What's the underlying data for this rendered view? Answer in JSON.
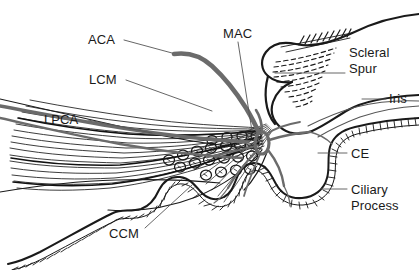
{
  "figure": {
    "type": "anatomical-line-drawing",
    "width": 419,
    "height": 270,
    "background_color": "#ffffff",
    "ink_color": "#1a1a1a",
    "vessel_color": "#6b6b6b",
    "leader_color": "#555555"
  },
  "labels": {
    "aca": {
      "text": "ACA",
      "full_name": "anterior ciliary artery",
      "x": 88,
      "y": 32,
      "leader": {
        "x1": 124,
        "y1": 40,
        "x2": 172,
        "y2": 53
      }
    },
    "lcm": {
      "text": "LCM",
      "full_name": "longitudinal ciliary muscle",
      "x": 89,
      "y": 72,
      "leader": {
        "x1": 126,
        "y1": 80,
        "x2": 210,
        "y2": 110
      }
    },
    "lpca": {
      "text": "LPCA",
      "full_name": "long posterior ciliary artery",
      "x": 44,
      "y": 112,
      "leader": {
        "x1": 88,
        "y1": 120,
        "x2": 152,
        "y2": 133
      }
    },
    "mac": {
      "text": "MAC",
      "full_name": "major arterial circle",
      "x": 223,
      "y": 26,
      "leader": {
        "x1": 238,
        "y1": 42,
        "x2": 250,
        "y2": 130
      }
    },
    "scleral_spur": {
      "text": "Scleral\nSpur",
      "line1": "Scleral",
      "line2": "Spur",
      "x": 349,
      "y": 45,
      "leader": {
        "x1": 275,
        "y1": 73,
        "x2": 345,
        "y2": 73
      }
    },
    "iris": {
      "text": "Iris",
      "x": 389,
      "y": 91,
      "leader": {
        "x1": 362,
        "y1": 99,
        "x2": 386,
        "y2": 99
      }
    },
    "ce": {
      "text": "CE",
      "full_name": "ciliary epithelium",
      "x": 351,
      "y": 146,
      "leader": {
        "x1": 318,
        "y1": 153,
        "x2": 347,
        "y2": 153
      }
    },
    "ciliary_process": {
      "text": "Ciliary Process",
      "line1": "Ciliary",
      "line2": "Process",
      "x": 351,
      "y": 182,
      "leader": {
        "x1": 321,
        "y1": 189,
        "x2": 347,
        "y2": 189
      }
    },
    "ccm": {
      "text": "CCM",
      "full_name": "circular ciliary muscle",
      "x": 109,
      "y": 226,
      "leader": {
        "x1": 145,
        "y1": 228,
        "x2": 190,
        "y2": 186
      }
    }
  },
  "structures": [
    {
      "name": "sclera-outer-wall",
      "kind": "outline"
    },
    {
      "name": "scleral-spur-wedge",
      "kind": "hatched-wedge"
    },
    {
      "name": "trabecular-meshwork",
      "kind": "dashed-band"
    },
    {
      "name": "longitudinal-ciliary-muscle-fibers",
      "kind": "fiber-bundle"
    },
    {
      "name": "circular-ciliary-muscle-bundles",
      "kind": "circle-cluster"
    },
    {
      "name": "ciliary-epithelium-beaded-line",
      "kind": "beaded-line"
    },
    {
      "name": "ciliary-processes",
      "kind": "beaded-folds"
    },
    {
      "name": "iris-root",
      "kind": "outline"
    },
    {
      "name": "major-arterial-circle-vessel",
      "kind": "vessel"
    },
    {
      "name": "long-posterior-ciliary-artery-vessel",
      "kind": "vessel"
    },
    {
      "name": "anterior-ciliary-artery-vessel",
      "kind": "vessel"
    }
  ]
}
